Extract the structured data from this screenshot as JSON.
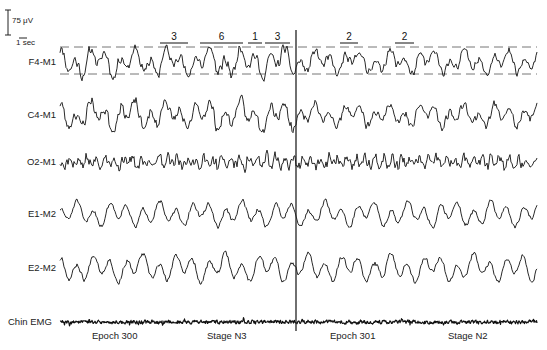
{
  "scale_bar": {
    "amplitude_label": "75 μV",
    "time_label": "1 sec"
  },
  "channels": [
    {
      "label": "F4-M1",
      "y": 62,
      "amp": 13,
      "seed": 11,
      "style": "slow"
    },
    {
      "label": "C4-M1",
      "y": 115,
      "amp": 13,
      "seed": 23,
      "style": "slow"
    },
    {
      "label": "O2-M1",
      "y": 162,
      "amp": 9,
      "seed": 37,
      "style": "fast"
    },
    {
      "label": "E1-M2",
      "y": 214,
      "amp": 11,
      "seed": 51,
      "style": "eye"
    },
    {
      "label": "E2-M2",
      "y": 268,
      "amp": 12,
      "seed": 67,
      "style": "eye"
    },
    {
      "label": "Chin EMG",
      "y": 322,
      "amp": 2,
      "seed": 83,
      "style": "emg"
    }
  ],
  "annotations": [
    {
      "label": "3",
      "x1": 160,
      "x2": 188
    },
    {
      "label": "6",
      "x1": 200,
      "x2": 243
    },
    {
      "label": "1",
      "x1": 248,
      "x2": 262
    },
    {
      "label": "3",
      "x1": 265,
      "x2": 290
    },
    {
      "label": "2",
      "x1": 340,
      "x2": 358
    },
    {
      "label": "2",
      "x1": 395,
      "x2": 414
    }
  ],
  "threshold_lines": {
    "upper_y": 47,
    "lower_y": 74
  },
  "epoch_divider_x": 296,
  "footer": {
    "left_epoch": "Epoch 300",
    "left_stage": "Stage N3",
    "right_epoch": "Epoch 301",
    "right_stage": "Stage N2"
  }
}
